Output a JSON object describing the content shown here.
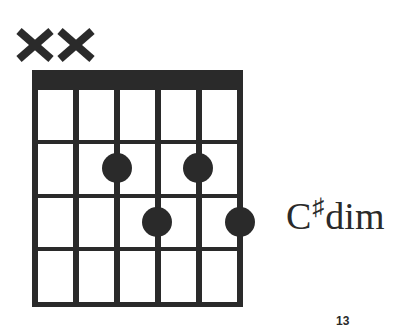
{
  "chord": {
    "root": "C",
    "accidental": "♯",
    "quality": "dim",
    "name": "C♯dim"
  },
  "diagram": {
    "num_strings": 6,
    "num_frets": 4,
    "nut": true,
    "muted_strings": [
      1,
      2
    ],
    "muted_symbol": "X",
    "dots": [
      {
        "string": 3,
        "fret": 2
      },
      {
        "string": 5,
        "fret": 2
      },
      {
        "string": 4,
        "fret": 3
      },
      {
        "string": 6,
        "fret": 3
      }
    ],
    "color": "#2a2a2a"
  },
  "page": {
    "number": "13"
  }
}
